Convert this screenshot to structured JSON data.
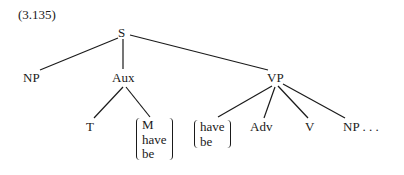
{
  "example_number": "(3.135)",
  "tree": {
    "root": "S",
    "level1": [
      "NP",
      "Aux",
      "VP"
    ],
    "aux_children": {
      "t": "T",
      "modal_brace": [
        "M",
        "have",
        "be"
      ]
    },
    "vp_children": {
      "aux_brace": [
        "have",
        "be"
      ],
      "adv": "Adv",
      "v": "V",
      "np": "NP . . ."
    }
  },
  "edges": [
    [
      "S",
      "NP"
    ],
    [
      "S",
      "Aux"
    ],
    [
      "S",
      "VP"
    ],
    [
      "Aux",
      "T"
    ],
    [
      "Aux",
      "{M, have, be}"
    ],
    [
      "VP",
      "{have, be}"
    ],
    [
      "VP",
      "Adv"
    ],
    [
      "VP",
      "V"
    ],
    [
      "VP",
      "NP . . ."
    ]
  ]
}
